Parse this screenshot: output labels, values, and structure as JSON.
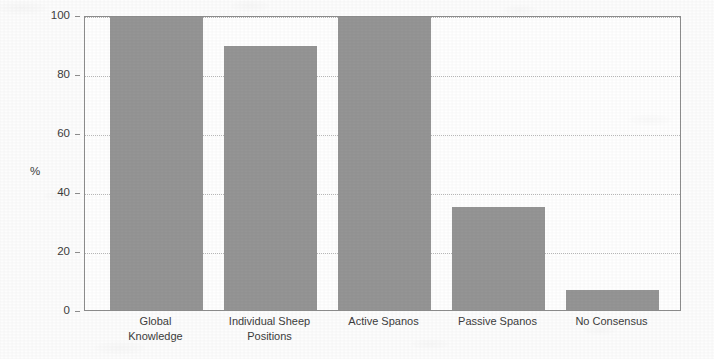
{
  "chart_data": {
    "type": "bar",
    "title": "",
    "subtitle": "",
    "xlabel": "",
    "ylabel": "%",
    "categories": [
      "Global\nKnowledge",
      "Individual Sheep\nPositions",
      "Active Spanos",
      "Passive Spanos",
      "No Consensus"
    ],
    "values": [
      100,
      90,
      100,
      35,
      7
    ],
    "ylim": [
      0,
      100
    ],
    "yticks": [
      0,
      20,
      40,
      60,
      80,
      100
    ],
    "ytick_labels": [
      "0",
      "20",
      "40",
      "60",
      "80",
      "100"
    ],
    "grid": true,
    "grid_axis": "y",
    "legend": false,
    "legend_position": "none",
    "series": [
      {
        "name": "",
        "values": [
          100,
          90,
          100,
          35,
          7
        ]
      }
    ],
    "annotations": []
  },
  "style": {
    "bar_color": "#959595",
    "plot_background": "#ffffff",
    "figure_background": "#fdfdfd",
    "gridline_color": "#b9b9b9",
    "axis_color": "#8e8e8e",
    "text_color": "#3c3c3c"
  }
}
